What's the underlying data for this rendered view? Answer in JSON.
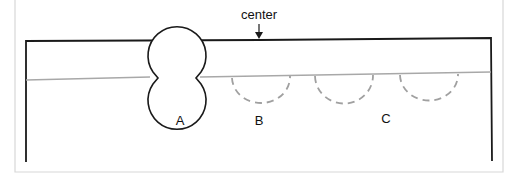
{
  "labels": {
    "center": "center",
    "a": "A",
    "b": "B",
    "c": "C"
  },
  "colors": {
    "frame": "#d8d8d8",
    "outline": "#1a1a1a",
    "thread": "#a8a8a8",
    "dashed": "#a0a0a0"
  }
}
